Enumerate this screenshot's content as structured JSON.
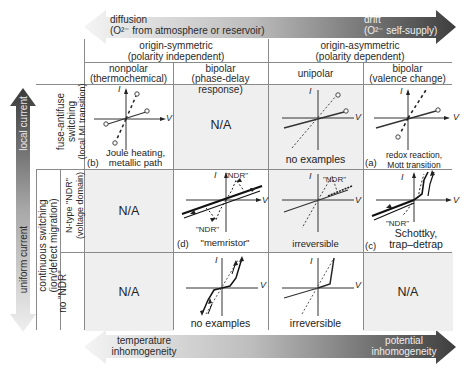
{
  "top_arrow": {
    "left_label": "diffusion",
    "left_sub": "(O²⁻ from atmosphere or reservoir)",
    "right_label": "drift",
    "right_sub": "(O²⁻ self-supply)",
    "colors": {
      "light": "#f2f2f2",
      "dark": "#4a4a4a"
    }
  },
  "bottom_arrow": {
    "left_label_1": "temperature",
    "left_label_2": "inhomogeneity",
    "right_label_1": "potential",
    "right_label_2": "inhomogeneity"
  },
  "left_arrow": {
    "top_label": "local current",
    "bottom_label": "uniform current"
  },
  "header": {
    "group_symmetric": {
      "line1": "origin-symmetric",
      "line2": "(polarity independent)"
    },
    "group_asymmetric": {
      "line1": "origin-asymmetric",
      "line2": "(polarity dependent)"
    },
    "columns": [
      {
        "line1": "nonpolar",
        "line2": "(thermochemical)"
      },
      {
        "line1": "bipolar",
        "line2": "(phase-delay response)"
      },
      {
        "line1": "unipolar",
        "line2": ""
      },
      {
        "line1": "bipolar",
        "line2": "(valence change)"
      }
    ]
  },
  "rows": {
    "fuse": {
      "line1": "fuse-antifuse",
      "line2": "switching",
      "line3": "(local MI transition)"
    },
    "continuous": {
      "line1": "continuous switching",
      "line2": "(ion/defect migration)"
    },
    "ntype": {
      "line1": "N-type \"NDR\"",
      "line2": "(voltage domain)"
    },
    "nondr": {
      "line1": "no \"NDR\""
    }
  },
  "cells": {
    "r1c1": {
      "letter": "(b)",
      "caption1": "Joule heating,",
      "caption2": "metallic path"
    },
    "r1c2": {
      "text": "N/A"
    },
    "r1c3": {
      "caption1": "no examples"
    },
    "r1c4": {
      "letter": "(a)",
      "caption1": "redox reaction,",
      "caption2": "Mott transition"
    },
    "r2c1": {
      "text": "N/A"
    },
    "r2c2": {
      "letter": "(d)",
      "caption1": "\"memristor\"",
      "ndr_top": "\"NDR\"",
      "ndr_bottom": "\"NDR\""
    },
    "r2c3": {
      "caption1": "irreversible",
      "ndr_top": "\"NDR\""
    },
    "r2c4": {
      "letter": "(c)",
      "caption1": "Schottky,",
      "caption2": "trap–detrap",
      "ndr_bottom": "\"NDR\""
    },
    "r3c1": {
      "text": "N/A"
    },
    "r3c2": {
      "caption1": "no examples"
    },
    "r3c3": {
      "caption1": "irreversible"
    },
    "r3c4": {
      "text": "N/A"
    }
  },
  "axes": {
    "i_label": "I",
    "v_label": "V"
  }
}
